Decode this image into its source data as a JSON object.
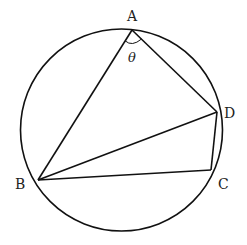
{
  "diagram": {
    "circle": {
      "cx": 121.5,
      "cy": 130,
      "r": 101
    },
    "points": {
      "A": {
        "x": 132,
        "y": 30
      },
      "B": {
        "x": 38,
        "y": 180
      },
      "C": {
        "x": 211,
        "y": 170
      },
      "D": {
        "x": 217,
        "y": 112
      }
    },
    "labels": {
      "A": "A",
      "B": "B",
      "C": "C",
      "D": "D",
      "angle": "θ"
    },
    "segments": [
      "AB",
      "AD",
      "BD",
      "BC",
      "CD"
    ],
    "angle_marker": {
      "vertex": "A",
      "between": [
        "B",
        "D"
      ],
      "label": "θ"
    },
    "stroke_color": "#111111"
  }
}
